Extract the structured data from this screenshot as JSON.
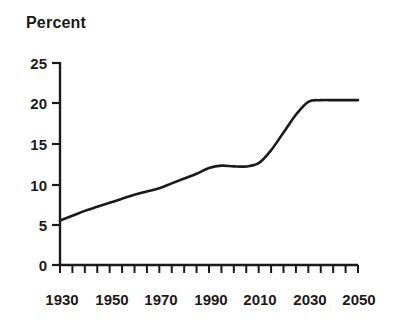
{
  "chart_data": {
    "type": "line",
    "title": "Percent",
    "xlabel": "",
    "ylabel": "",
    "xlim": [
      1930,
      2050
    ],
    "ylim": [
      0,
      25
    ],
    "grid": false,
    "legend": null,
    "x_tick_labels": [
      "1930",
      "1950",
      "1970",
      "1990",
      "2010",
      "2030",
      "2050"
    ],
    "x_ticks": [
      1930,
      1950,
      1970,
      1990,
      2010,
      2030,
      2050
    ],
    "x_minor_tick_step": 5,
    "y_tick_labels": [
      "0",
      "5",
      "10",
      "15",
      "20",
      "25"
    ],
    "y_ticks": [
      0,
      5,
      10,
      15,
      20,
      25
    ],
    "series": [
      {
        "name": "Percent",
        "color": "#1a1a1a",
        "x": [
          1930,
          1935,
          1940,
          1945,
          1950,
          1955,
          1960,
          1965,
          1970,
          1975,
          1980,
          1985,
          1990,
          1995,
          2000,
          2005,
          2010,
          2015,
          2020,
          2025,
          2030,
          2035,
          2040,
          2045,
          2050
        ],
        "values": [
          5.5,
          6.1,
          6.7,
          7.2,
          7.7,
          8.2,
          8.7,
          9.1,
          9.5,
          10.1,
          10.7,
          11.3,
          12.0,
          12.3,
          12.2,
          12.2,
          12.6,
          14.2,
          16.4,
          18.6,
          20.2,
          20.4,
          20.4,
          20.4,
          20.4
        ]
      }
    ],
    "annotations": []
  },
  "axes": {
    "title_text": "Percent"
  }
}
